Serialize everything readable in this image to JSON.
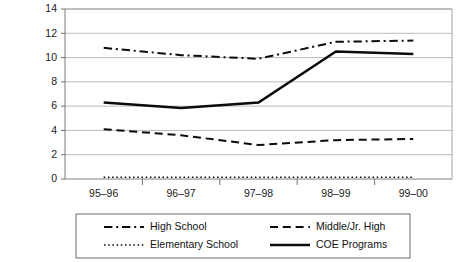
{
  "chart_data": {
    "type": "line",
    "title": "",
    "subtitle": "",
    "xlabel": "",
    "ylabel": "",
    "categories": [
      "95–96",
      "96–97",
      "97–98",
      "98–99",
      "99–00"
    ],
    "x_tick_labels": [
      "95–96",
      "96–97",
      "97–98",
      "98–99",
      "99–00"
    ],
    "y_tick_labels": [
      "0",
      "2",
      "4",
      "6",
      "8",
      "10",
      "12",
      "14"
    ],
    "y_ticks": [
      0,
      2,
      4,
      6,
      8,
      10,
      12,
      14
    ],
    "ylim": [
      0,
      14
    ],
    "grid": "horizontal",
    "legend_position": "bottom",
    "series": [
      {
        "name": "High School",
        "style": "dash-dot",
        "color": "#0b0b0b",
        "width": 2.0,
        "values": [
          10.8,
          10.2,
          9.9,
          11.3,
          11.4
        ]
      },
      {
        "name": "Middle/Jr. High",
        "style": "dashed",
        "color": "#0b0b0b",
        "width": 2.0,
        "values": [
          4.1,
          3.6,
          2.8,
          3.2,
          3.3
        ]
      },
      {
        "name": "Elementary School",
        "style": "dotted",
        "color": "#0b0b0b",
        "width": 1.4,
        "values": [
          0.15,
          0.15,
          0.15,
          0.15,
          0.15
        ]
      },
      {
        "name": "COE Programs",
        "style": "solid",
        "color": "#0b0b0b",
        "width": 2.6,
        "values": [
          6.3,
          5.85,
          6.3,
          10.5,
          10.3
        ]
      }
    ]
  },
  "legend": {
    "entries": [
      {
        "label": "High School",
        "style": "dash-dot"
      },
      {
        "label": "Middle/Jr. High",
        "style": "dashed"
      },
      {
        "label": "Elementary School",
        "style": "dotted"
      },
      {
        "label": "COE Programs",
        "style": "solid"
      }
    ]
  }
}
